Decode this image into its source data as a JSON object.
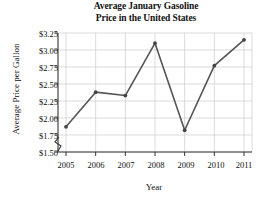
{
  "chart_data": {
    "type": "line",
    "title": "Average January Gasoline Price in the United States",
    "title_line1": "Average January Gasoline",
    "title_line2": "Price in the United States",
    "xlabel": "Year",
    "ylabel": "Average Price per Gallon",
    "categories": [
      2005,
      2006,
      2007,
      2008,
      2009,
      2010,
      2011
    ],
    "x_tick_labels": [
      "2005",
      "2006",
      "2007",
      "2008",
      "2009",
      "2010",
      "2011"
    ],
    "values": [
      1.87,
      2.38,
      2.33,
      3.1,
      1.82,
      2.77,
      3.15
    ],
    "y_tick_values": [
      1.5,
      1.75,
      2.0,
      2.25,
      2.5,
      2.75,
      3.0,
      3.25
    ],
    "y_tick_labels": [
      "$1.50",
      "$1.75",
      "$2.00",
      "$2.25",
      "$2.50",
      "$2.75",
      "$3.00",
      "$3.25"
    ],
    "ylim": [
      1.5,
      3.25
    ],
    "xlim": [
      2005,
      2011
    ],
    "grid": true,
    "legend": false,
    "axis_break": true,
    "series_name": "Average January Gasoline Price",
    "line_color": "#555555",
    "marker_color": "#444444",
    "grid_color": "#cccccc",
    "axis_color": "#333333",
    "background_color": "#ffffff"
  }
}
